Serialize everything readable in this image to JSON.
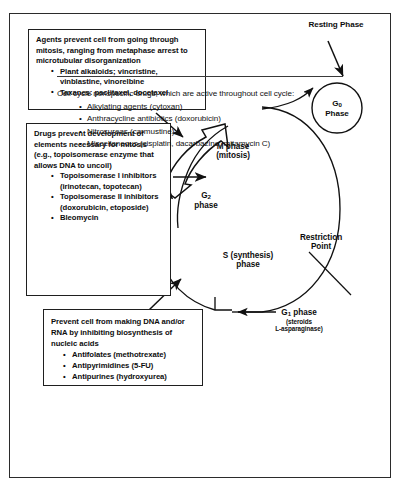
{
  "boxes": {
    "mitosis": {
      "intro": "Agents prevent cell from going through mitosis, ranging from metaphase arrest to microtubular disorganization",
      "items": [
        "Plant alkaloids; vincristine, vinblastine, vinorelbine",
        "Taxanes: paclitaxel, docetaxel"
      ]
    },
    "topoisomerase": {
      "intro": "Drugs prevent development of elements necessary for mitosis (e.g., topoisomerase enzyme that allows DNA to uncoil)",
      "items": [
        "Topoisomerase I inhibitors (irinotecan, topotecan)",
        "Topoisomerase II inhibitors (doxorubicin, etoposide)",
        "Bleomycin"
      ]
    },
    "antimetabolites": {
      "intro": "Prevent cell from making DNA and/or RNA by inhibiting biosynthesis of nucleic acids",
      "items": [
        "Antifolates (methotrexate)",
        "Antipyrimidines (5-FU)",
        "Antipurines (hydroxyurea)"
      ]
    }
  },
  "footer": {
    "intro": "Cell cycle nonspecific drugs, which are active throughout cell cycle:",
    "items": [
      "Alkylating agents (cytoxan)",
      "Anthracycline antibiotics (doxorubicin)",
      "Nitrosureas (carmustine)",
      "Miscellaneous (cisplatin, dacarbazine, mitamycin C)"
    ]
  },
  "diagram": {
    "resting_phase": "Resting Phase",
    "g0_line1": "G",
    "g0_sub": "0",
    "g0_line2": "Phase",
    "m_phase_line1": "M phase",
    "m_phase_line2": "(mitosis)",
    "g2_line1": "G",
    "g2_sub": "2",
    "g2_line2": "phase",
    "s_phase_line1": "S (synthesis)",
    "s_phase_line2": "phase",
    "restriction_line1": "Restriction",
    "restriction_line2": "Point",
    "g1_line1": "G",
    "g1_sub": "1",
    "g1_label": " phase",
    "g1_sub1": "(steroids",
    "g1_sub2": "L-asparaginase)"
  },
  "colors": {
    "ink": "#111111",
    "frame": "#2b2b2b",
    "background": "#ffffff"
  }
}
